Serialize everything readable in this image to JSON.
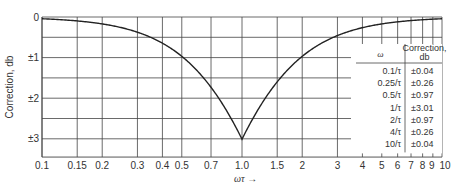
{
  "chart_data": {
    "type": "line",
    "title": "",
    "xlabel": "ωτ →",
    "ylabel": "Correction, db",
    "xscale": "log",
    "xlim": [
      0.1,
      10
    ],
    "ylim": [
      0,
      3.45
    ],
    "y_inverted": true,
    "grid": true,
    "x_ticks": [
      "0.1",
      "0.15",
      "0.2",
      "0.3",
      "0.4",
      "0.5",
      "0.7",
      "1.0",
      "1.5",
      "2",
      "3",
      "4",
      "5",
      "6",
      "7",
      "8",
      "9",
      "10"
    ],
    "x_tick_values": [
      0.1,
      0.15,
      0.2,
      0.3,
      0.4,
      0.5,
      0.7,
      1.0,
      1.5,
      2,
      3,
      4,
      5,
      6,
      7,
      8,
      9,
      10
    ],
    "y_ticks": [
      "0",
      "±1",
      "±2",
      "±3"
    ],
    "y_tick_values": [
      0,
      1,
      2,
      3
    ],
    "y_grid_values": [
      0,
      0.5,
      1,
      1.5,
      2,
      2.5,
      3
    ],
    "series": [
      {
        "name": "Correction",
        "x": [
          0.1,
          0.15,
          0.2,
          0.25,
          0.3,
          0.4,
          0.5,
          0.6,
          0.7,
          0.8,
          0.9,
          1.0,
          1.11,
          1.25,
          1.43,
          1.67,
          2,
          2.5,
          3.33,
          4,
          5,
          6.67,
          10
        ],
        "values": [
          0.04,
          0.1,
          0.17,
          0.26,
          0.37,
          0.64,
          0.97,
          1.34,
          1.73,
          2.15,
          2.57,
          3.01,
          2.57,
          2.15,
          1.73,
          1.34,
          0.97,
          0.64,
          0.37,
          0.26,
          0.17,
          0.1,
          0.04
        ]
      }
    ],
    "table": {
      "headers": [
        "ω",
        "Correction, db"
      ],
      "rows": [
        [
          "0.1/τ",
          "±0.04"
        ],
        [
          "0.25/τ",
          "±0.26"
        ],
        [
          "0.5/τ",
          "±0.97"
        ],
        [
          "1/τ",
          "±3.01"
        ],
        [
          "2/τ",
          "±0.97"
        ],
        [
          "4/τ",
          "±0.26"
        ],
        [
          "10/τ",
          "±0.04"
        ]
      ]
    }
  }
}
